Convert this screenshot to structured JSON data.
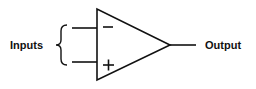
{
  "diagram": {
    "inputs_label": "Inputs",
    "output_label": "Output",
    "inverting_symbol": "−",
    "non_inverting_symbol": "+",
    "stroke_color": "#111111",
    "background": "#ffffff"
  }
}
